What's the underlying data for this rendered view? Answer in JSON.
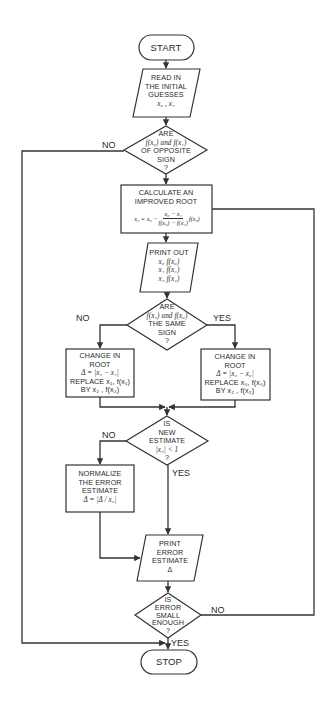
{
  "flowchart": {
    "title": "Secant / Regula Falsi root-finding flowchart",
    "nodes": {
      "start": {
        "type": "terminal",
        "lines": [
          "START"
        ]
      },
      "read": {
        "type": "io",
        "lines": [
          "READ IN",
          "THE INITIAL",
          "GUESSES",
          "x₀ , x₁"
        ]
      },
      "d1": {
        "type": "decision",
        "lines": [
          "ARE",
          "f(x₀) and f(x₁)",
          "OF OPPOSITE",
          "SIGN",
          "?"
        ]
      },
      "calc": {
        "type": "process",
        "lines": [
          "CALCULATE AN",
          "IMPROVED ROOT"
        ],
        "formula": {
          "lhs": "x₂ = x₀ −",
          "num": "x₀ − x₁",
          "den": "f(x₀) − f(x₁)",
          "rhs": "f(x₀)"
        }
      },
      "print": {
        "type": "io",
        "lines": [
          "PRINT OUT",
          "x₀  f(x₀)",
          "x₁  f(x₁)",
          "x₂  f(x₂)"
        ]
      },
      "d2": {
        "type": "decision",
        "lines": [
          "ARE",
          "f(x₂) and f(x₀)",
          "THE SAME",
          "SIGN",
          "?"
        ]
      },
      "left": {
        "type": "process",
        "lines": [
          "CHANGE IN",
          "ROOT",
          "Δ = |x₂ − x₁|",
          "REPLACE x₁, f(x₁)",
          "BY x₂ , f(x₂)"
        ]
      },
      "right": {
        "type": "process",
        "lines": [
          "CHANGE IN",
          "ROOT",
          "Δ = |x₂ − x₀|",
          "REPLACE x₀, f(x₀)",
          "BY x₂ , f(x₂)"
        ]
      },
      "d3": {
        "type": "decision",
        "lines": [
          "IS",
          "NEW",
          "ESTIMATE",
          "|x₂| < 1",
          "?"
        ]
      },
      "norm": {
        "type": "process",
        "lines": [
          "NORMALIZE",
          "THE ERROR",
          "ESTIMATE",
          "Δ = |Δ / x₂|"
        ]
      },
      "perr": {
        "type": "io",
        "lines": [
          "PRINT",
          "ERROR",
          "ESTIMATE",
          "Δ"
        ]
      },
      "d4": {
        "type": "decision",
        "lines": [
          "IS",
          "ERROR",
          "SMALL",
          "ENOUGH",
          "?"
        ]
      },
      "stop": {
        "type": "terminal",
        "lines": [
          "STOP"
        ]
      }
    },
    "edge_labels": {
      "d1_no": "NO",
      "d2_no": "NO",
      "d2_yes": "YES",
      "d3_no": "NO",
      "d3_yes": "YES",
      "d4_no": "NO",
      "d4_yes": "YES"
    },
    "colors": {
      "line": "#333333",
      "text": "#2a2a2a",
      "background": "#ffffff"
    }
  }
}
